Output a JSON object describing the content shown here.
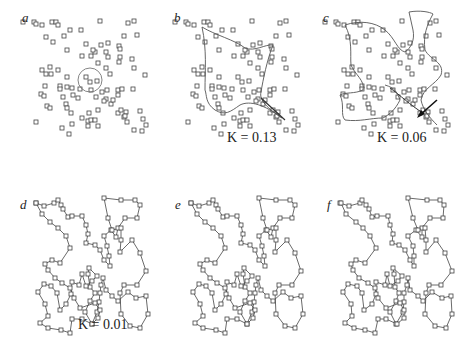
{
  "figure": {
    "panels": [
      {
        "id": "a",
        "label": "a",
        "k_label": "",
        "mode": "ring"
      },
      {
        "id": "b",
        "label": "b",
        "k_label": "K = 0.13",
        "mode": "curve1"
      },
      {
        "id": "c",
        "label": "c",
        "k_label": "K = 0.06",
        "mode": "curve2"
      },
      {
        "id": "d",
        "label": "d",
        "k_label": "K = 0.01",
        "mode": "tour"
      },
      {
        "id": "e",
        "label": "e",
        "k_label": "",
        "mode": "tour"
      },
      {
        "id": "f",
        "label": "f",
        "k_label": "",
        "mode": "tour2"
      }
    ],
    "k_symbol": "K",
    "colors": {
      "ink": "#333333",
      "curve": "#555555",
      "point_fill": "#ffffff"
    }
  }
}
